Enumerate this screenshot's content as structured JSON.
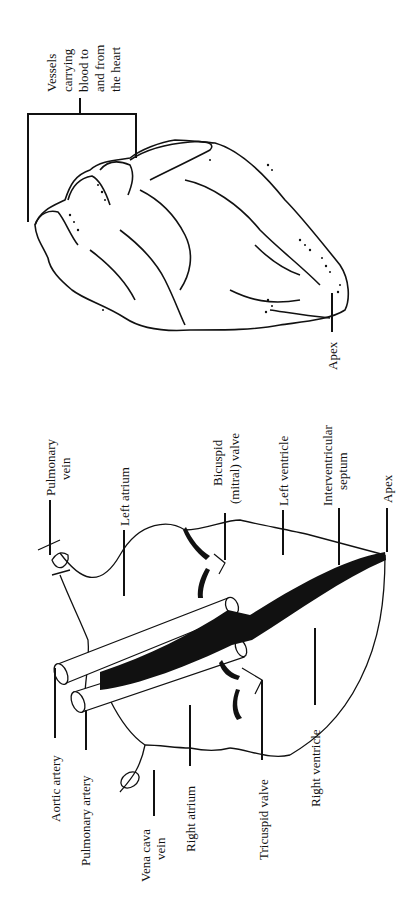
{
  "figure": {
    "top_panel": {
      "name": "external-heart-view",
      "labels": {
        "vessels": [
          "Vessels",
          "carrying",
          "blood to",
          "and from",
          "the heart"
        ],
        "apex": "Apex"
      }
    },
    "bottom_panel": {
      "name": "internal-heart-diagram",
      "labels": {
        "pulmonary_vein": [
          "Pulmonary",
          "vein"
        ],
        "left_atrium": "Left atrium",
        "bicuspid_valve": [
          "Bicuspid",
          "(mitral) valve"
        ],
        "left_ventricle": "Left ventricle",
        "interventricular_septum": [
          "Interventricular",
          "septum"
        ],
        "apex": "Apex",
        "aortic_artery": "Aortic artery",
        "pulmonary_artery": "Pulmonary artery",
        "vena_cava_vein": [
          "Vena cava",
          "vein"
        ],
        "right_atrium": "Right atrium",
        "tricuspid_valve": "Tricuspid valve",
        "right_ventricle": "Right ventricle"
      }
    }
  }
}
